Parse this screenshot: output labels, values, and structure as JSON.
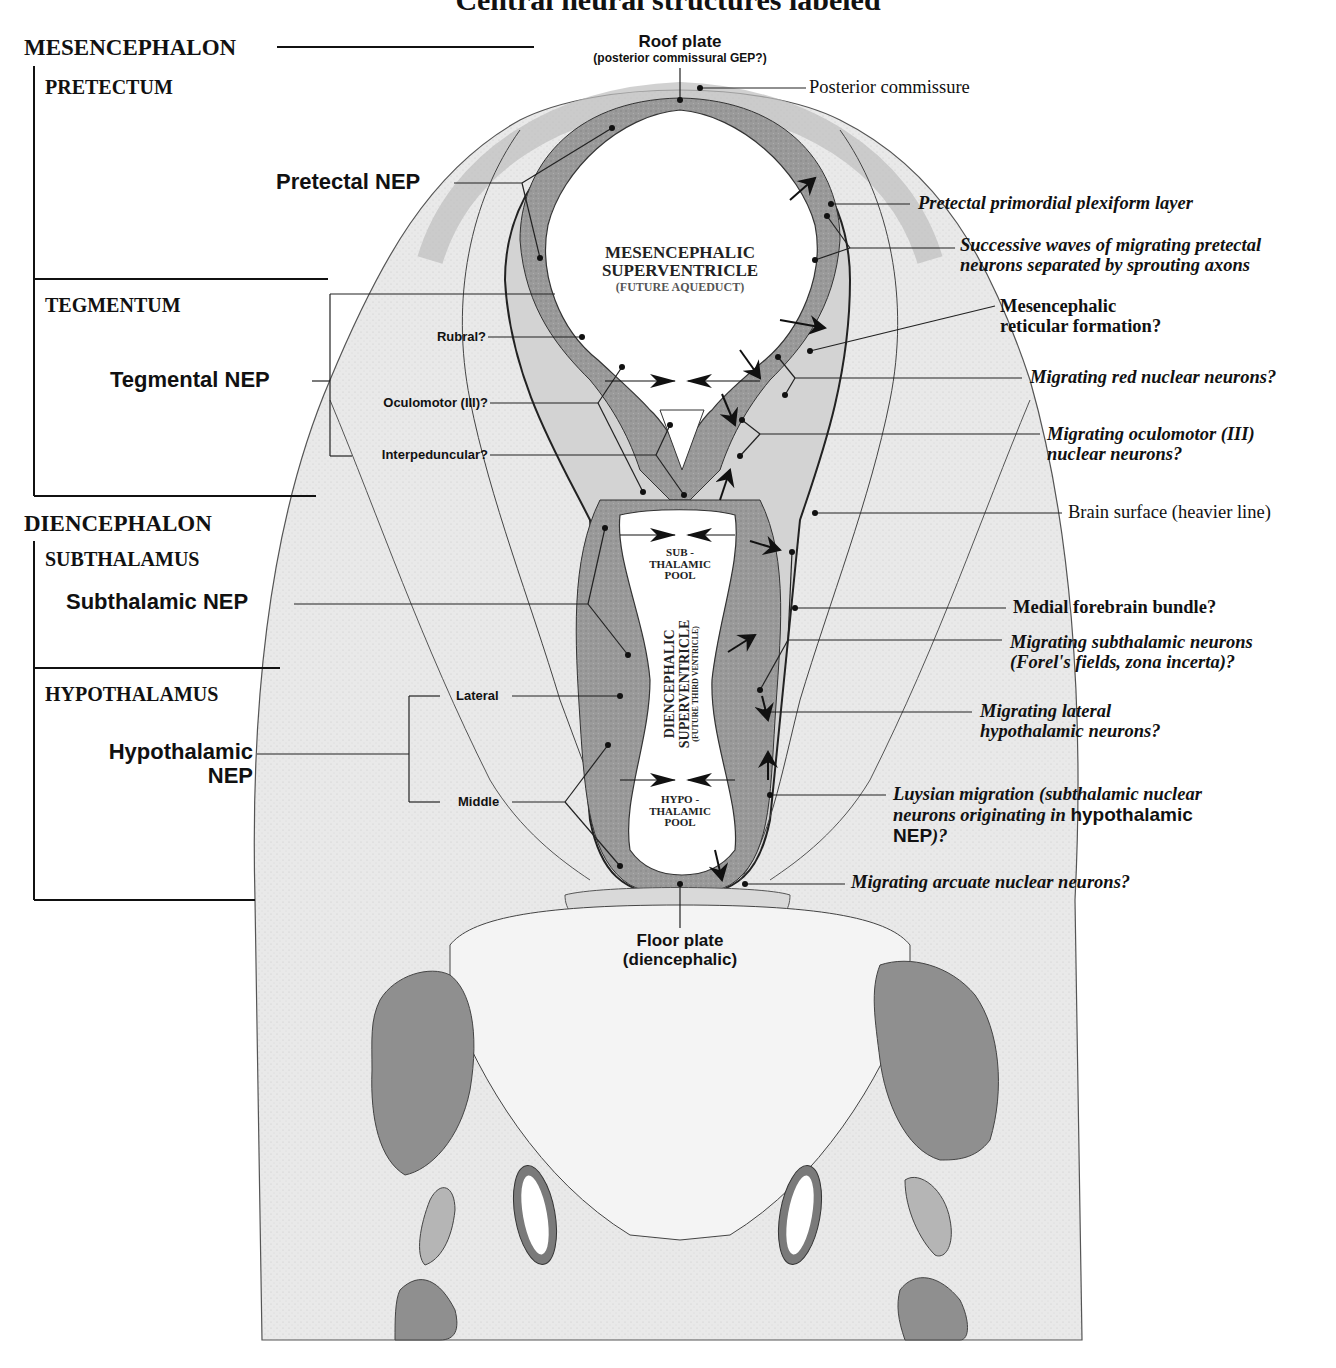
{
  "title": "Central neural structures labeled",
  "divisions": {
    "mesencephalon": "MESENCEPHALON",
    "pretectum": "PRETECTUM",
    "tegmentum": "TEGMENTUM",
    "diencephalon": "DIENCEPHALON",
    "subthalamus": "SUBTHALAMUS",
    "hypothalamus": "HYPOTHALAMUS"
  },
  "neuroepithelia": {
    "pretectal": "Pretectal NEP",
    "tegmental": "Tegmental NEP",
    "subthalamic": "Subthalamic NEP",
    "hypothalamic_line1": "Hypothalamic",
    "hypothalamic_line2": "NEP"
  },
  "tegmental_subdivisions": {
    "rubral": "Rubral?",
    "oculomotor": "Oculomotor (III)?",
    "interpeduncular": "Interpeduncular?"
  },
  "hypothalamic_subdivisions": {
    "lateral": "Lateral",
    "middle": "Middle"
  },
  "midline": {
    "roof_plate": "Roof plate",
    "roof_plate_sub": "(posterior commissural GEP?)",
    "floor_plate": "Floor plate",
    "floor_plate_sub": "(diencephalic)"
  },
  "ventricles": {
    "mesencephalic_line1": "MESENCEPHALIC",
    "mesencephalic_line2": "SUPERVENTRICLE",
    "mesencephalic_line3": "(FUTURE AQUEDUCT)",
    "subthalamic_pool_line1": "SUB -",
    "subthalamic_pool_line2": "THALAMIC",
    "subthalamic_pool_line3": "POOL",
    "diencephalic_line1": "DIENCEPHALIC",
    "diencephalic_line2": "SUPERVENTRICLE",
    "diencephalic_line3": "(FUTURE THIRD VENTRICLE)",
    "hypothalamic_pool_line1": "HYPO -",
    "hypothalamic_pool_line2": "THALAMIC",
    "hypothalamic_pool_line3": "POOL"
  },
  "right_labels": {
    "posterior_commissure": "Posterior commissure",
    "pretectal_ppl": "Pretectal primordial plexiform layer",
    "successive_waves_line1": "Successive waves of migrating pretectal",
    "successive_waves_line2": "neurons separated by sprouting axons",
    "mrf_line1": "Mesencephalic",
    "mrf_line2": "reticular formation?",
    "red_nuclear": "Migrating red nuclear neurons?",
    "oculomotor_line1": "Migrating oculomotor (III)",
    "oculomotor_line2": "nuclear neurons?",
    "brain_surface": "Brain surface (heavier line)",
    "mfb": "Medial forebrain bundle?",
    "subthalamic_line1": "Migrating subthalamic neurons",
    "subthalamic_line2": "(Forel's fields, zona incerta)?",
    "lat_hypo_line1": "Migrating lateral",
    "lat_hypo_line2": "hypothalamic neurons?",
    "luysian_line1": "Luysian migration (subthalamic nuclear",
    "luysian_line2a": "neurons originating in ",
    "luysian_line2b": "hypothalamic",
    "luysian_line3a": "NEP",
    "luysian_line3b": ")?",
    "arcuate": "Migrating arcuate nuclear neurons?"
  },
  "colors": {
    "background": "#ffffff",
    "tissue_light": "#e6e6e6",
    "tissue_mid": "#cfcfcf",
    "neuroepithelium": "#8e8e8e",
    "ventricle": "#ffffff",
    "ink": "#111111"
  }
}
